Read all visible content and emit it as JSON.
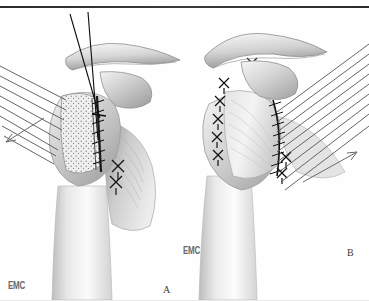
{
  "figure": {
    "domain": "medical-illustration",
    "style": "greyscale-anatomical-line-drawing",
    "background_color": "#ffffff",
    "ink_color": "#1a1a1a",
    "shade_mid": "#9a9a9a",
    "shade_light": "#d8d8d8",
    "width": 369,
    "height": 301,
    "top_rule_color": "#2c2c2c"
  },
  "labels": {
    "panel_a": "A",
    "panel_b": "B",
    "credit_left": "EMC",
    "credit_right": "EMC"
  },
  "panels": [
    {
      "id": "A",
      "label": "A",
      "caption_position": "bottom-right",
      "description": "Shoulder with deltoid reflected, tendon defect shown stippled and partly sutured; two long suture threads pass from above through the repair site.",
      "features": [
        "acromion",
        "clavicle",
        "coracoid",
        "humeral head",
        "humeral shaft",
        "stippled tendon patch",
        "running ladder suture line",
        "two X-sutures lateral",
        "two long vertical suture threads",
        "traction arrow lower-left"
      ],
      "hatching": {
        "direction": "down-left",
        "line_count": 9,
        "arrow": "lower-left",
        "color": "#555555"
      }
    },
    {
      "id": "B",
      "label": "B",
      "caption_position": "bottom-right",
      "description": "Completed repair: cuff reattached with a column of X-sutures medially and a continuous ladder suture laterally; retraction hatching directed to the right.",
      "features": [
        "acromion",
        "clavicle",
        "coracoid",
        "humeral head",
        "humeral shaft",
        "column of X-sutures",
        "continuous ladder suture line",
        "two lateral X-sutures",
        "traction arrow right"
      ],
      "hatching": {
        "direction": "down-right",
        "line_count": 10,
        "arrow": "right",
        "color": "#555555"
      }
    }
  ]
}
